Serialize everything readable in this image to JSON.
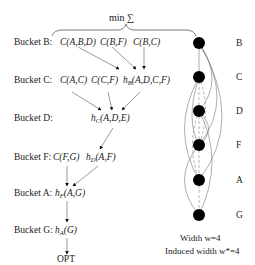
{
  "header": {
    "min_sum": "min ∑"
  },
  "buckets": [
    {
      "label": "Bucket B:",
      "terms": [
        "C(A,B,D)",
        "C(B,F)",
        "C(B,C)"
      ]
    },
    {
      "label": "Bucket C:",
      "terms": [
        "C(A,C)",
        "C(C,F)"
      ],
      "message": {
        "h": "h",
        "sub": "B",
        "args": "(A,D,C,F)"
      }
    },
    {
      "label": "Bucket D:",
      "terms": [],
      "message": {
        "h": "h",
        "sub": "C",
        "args": "(A,D,E)"
      }
    },
    {
      "label": "Bucket F:",
      "terms": [
        "C(F,G)"
      ],
      "message": {
        "h": "h",
        "sub": "D",
        "args": "(A,F)"
      }
    },
    {
      "label": "Bucket A:",
      "terms": [],
      "message": {
        "h": "h",
        "sub": "F",
        "args": "(A,G)"
      }
    },
    {
      "label": "Bucket G:",
      "terms": [],
      "message": {
        "h": "h",
        "sub": "A",
        "args": "(G)"
      }
    }
  ],
  "result": "OPT",
  "graph": {
    "nodes": [
      "B",
      "C",
      "D",
      "F",
      "A",
      "G"
    ],
    "width_label": "Width   w=4",
    "induced_width_label": "Induced width w*=4"
  }
}
